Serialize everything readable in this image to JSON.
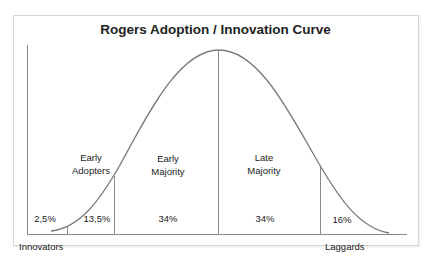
{
  "title": "Rogers Adoption / Innovation Curve",
  "segments": [
    {
      "name": "Innovators",
      "percent": "2,5%",
      "label_lines": [
        "Innovators"
      ]
    },
    {
      "name": "Early Adopters",
      "percent": "13,5%",
      "label_lines": [
        "Early",
        "Adopters"
      ]
    },
    {
      "name": "Early Majority",
      "percent": "34%",
      "label_lines": [
        "Early",
        "Majority"
      ]
    },
    {
      "name": "Late Majority",
      "percent": "34%",
      "label_lines": [
        "Late",
        "Majority"
      ]
    },
    {
      "name": "Laggards",
      "percent": "16%",
      "label_lines": [
        "Laggards"
      ]
    }
  ],
  "colors": {
    "curve": "#7a7a7a",
    "lines": "#8a8a8a",
    "text": "#222222",
    "frame": "#d6d6d6"
  }
}
